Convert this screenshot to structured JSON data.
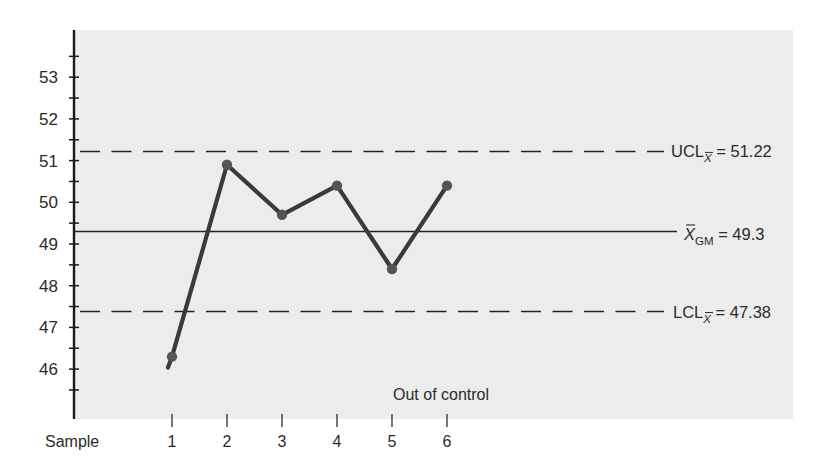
{
  "chart_data": {
    "type": "line",
    "title": "",
    "xlabel": "Sample",
    "ylabel": "",
    "categories": [
      "1",
      "2",
      "3",
      "4",
      "5",
      "6"
    ],
    "x": [
      1,
      2,
      3,
      4,
      5,
      6
    ],
    "series": [
      {
        "name": "Sample mean",
        "values": [
          46.3,
          50.9,
          49.7,
          50.4,
          48.4,
          50.4
        ]
      }
    ],
    "y_ticks": [
      46,
      47,
      48,
      49,
      50,
      51,
      52,
      53
    ],
    "ylim": [
      45,
      54
    ],
    "grid": false,
    "reference_lines": [
      {
        "name": "UCL",
        "label_main": "UCL",
        "label_sub": "X̄",
        "value": 51.22,
        "value_text": "= 51.22",
        "style": "dashed"
      },
      {
        "name": "Grand mean",
        "label_main": "X̄",
        "label_sub": "GM",
        "value": 49.3,
        "value_text": "= 49.3",
        "style": "solid"
      },
      {
        "name": "LCL",
        "label_main": "LCL",
        "label_sub": "X̄",
        "value": 47.38,
        "value_text": "= 47.38",
        "style": "dashed"
      }
    ],
    "annotations": [
      {
        "text": "Out of control",
        "near_sample": 5
      }
    ],
    "legend": "none"
  },
  "colors": {
    "panel": "#ececec",
    "line": "#3a3a3a",
    "axis": "#1a1a1a",
    "text": "#2b2b2b"
  }
}
